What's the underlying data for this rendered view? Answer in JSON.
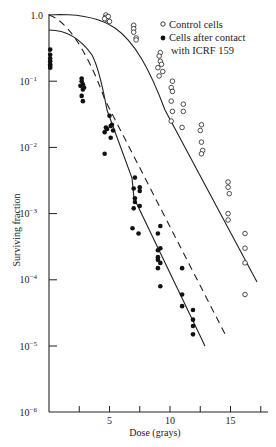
{
  "chart_data": {
    "type": "scatter",
    "title": "",
    "xlabel": "Dose (grays)",
    "ylabel": "Surviving fraction",
    "yscale": "log",
    "xlim": [
      0,
      18
    ],
    "ylim": [
      1e-06,
      1.0
    ],
    "grid": false,
    "legend_position": "upper right",
    "x_ticks": [
      2.5,
      5,
      7.5,
      10,
      12.5,
      15,
      17.5
    ],
    "x_tick_labels": [
      {
        "value": 5,
        "label": "5"
      },
      {
        "value": 10,
        "label": "10"
      },
      {
        "value": 15,
        "label": "15"
      }
    ],
    "y_tick_labels": [
      {
        "value": 1.0,
        "label": "1.0"
      },
      {
        "value": 0.1,
        "label": "10",
        "exp": "−1"
      },
      {
        "value": 0.01,
        "label": "10",
        "exp": "−2"
      },
      {
        "value": 0.001,
        "label": "10",
        "exp": "−3"
      },
      {
        "value": 0.0001,
        "label": "10",
        "exp": "−4"
      },
      {
        "value": 1e-05,
        "label": "10",
        "exp": "−5"
      },
      {
        "value": 1e-06,
        "label": "10",
        "exp": "−6"
      }
    ],
    "legend": [
      {
        "marker": "open-circle",
        "label": "Control cells"
      },
      {
        "marker": "filled-circle",
        "label": "Cells after contact",
        "label2": "with ICRF 159"
      }
    ],
    "series": [
      {
        "name": "Control cells",
        "marker": "open-circle",
        "points": [
          [
            4.7,
            1.0
          ],
          [
            4.7,
            0.92
          ],
          [
            4.8,
            0.85
          ],
          [
            4.6,
            0.88
          ],
          [
            5.0,
            0.8
          ],
          [
            4.9,
            0.95
          ],
          [
            7.0,
            0.7
          ],
          [
            7.0,
            0.62
          ],
          [
            7.0,
            0.55
          ],
          [
            7.2,
            0.45
          ],
          [
            7.2,
            0.42
          ],
          [
            9.2,
            0.27
          ],
          [
            9.1,
            0.24
          ],
          [
            9.2,
            0.2
          ],
          [
            9.0,
            0.16
          ],
          [
            9.1,
            0.12
          ],
          [
            9.3,
            0.18
          ],
          [
            9.4,
            0.14
          ],
          [
            10.2,
            0.1
          ],
          [
            10.1,
            0.08
          ],
          [
            10.2,
            0.07
          ],
          [
            10.1,
            0.05
          ],
          [
            10.2,
            0.035
          ],
          [
            11.1,
            0.045
          ],
          [
            11.1,
            0.035
          ],
          [
            10.1,
            0.025
          ],
          [
            11.0,
            0.02
          ],
          [
            12.6,
            0.022
          ],
          [
            12.5,
            0.018
          ],
          [
            12.6,
            0.012
          ],
          [
            12.7,
            0.009
          ],
          [
            12.6,
            0.008
          ],
          [
            14.8,
            0.003
          ],
          [
            14.8,
            0.0025
          ],
          [
            14.9,
            0.002
          ],
          [
            14.8,
            0.001
          ],
          [
            14.8,
            0.0008
          ],
          [
            16.2,
            0.0005
          ],
          [
            16.2,
            0.0003
          ],
          [
            16.2,
            0.00018
          ],
          [
            16.2,
            6e-05
          ]
        ],
        "fit_line": "solid"
      },
      {
        "name": "Cells after contact with ICRF 159",
        "marker": "filled-circle",
        "points": [
          [
            0.1,
            0.3
          ],
          [
            0.1,
            0.25
          ],
          [
            0.1,
            0.22
          ],
          [
            0.1,
            0.2
          ],
          [
            0.1,
            0.18
          ],
          [
            0.1,
            0.17
          ],
          [
            0.1,
            0.16
          ],
          [
            2.7,
            0.11
          ],
          [
            2.7,
            0.1
          ],
          [
            2.8,
            0.09
          ],
          [
            2.6,
            0.085
          ],
          [
            2.8,
            0.075
          ],
          [
            2.9,
            0.08
          ],
          [
            2.7,
            0.06
          ],
          [
            2.8,
            0.05
          ],
          [
            5.0,
            0.03
          ],
          [
            4.7,
            0.02
          ],
          [
            4.8,
            0.019
          ],
          [
            5.1,
            0.021
          ],
          [
            5.2,
            0.022
          ],
          [
            5.3,
            0.018
          ],
          [
            4.6,
            0.017
          ],
          [
            5.1,
            0.014
          ],
          [
            4.6,
            0.008
          ],
          [
            7.1,
            0.0035
          ],
          [
            7.0,
            0.0024
          ],
          [
            7.5,
            0.0025
          ],
          [
            7.5,
            0.0022
          ],
          [
            7.1,
            0.0017
          ],
          [
            7.1,
            0.0015
          ],
          [
            7.0,
            0.0012
          ],
          [
            7.5,
            0.0013
          ],
          [
            6.9,
            0.0006
          ],
          [
            7.4,
            0.0005
          ],
          [
            9.2,
            0.00065
          ],
          [
            9.0,
            0.0005
          ],
          [
            9.2,
            0.0003
          ],
          [
            9.0,
            0.00028
          ],
          [
            9.0,
            0.00022
          ],
          [
            9.0,
            0.0002
          ],
          [
            9.0,
            0.00015
          ],
          [
            9.2,
            0.00018
          ],
          [
            9.2,
            8e-05
          ],
          [
            11.0,
            0.00015
          ],
          [
            11.0,
            6e-05
          ],
          [
            11.0,
            4e-05
          ],
          [
            11.9,
            3.5e-05
          ],
          [
            11.9,
            2.5e-05
          ],
          [
            11.9,
            2e-05
          ],
          [
            11.9,
            1.5e-05
          ]
        ],
        "fit_line": "solid"
      },
      {
        "name": "Reference curve",
        "marker": "none",
        "fit_line": "dashed",
        "curve_approx": [
          [
            0,
            1.0
          ],
          [
            2.5,
            0.3
          ],
          [
            5,
            0.04
          ],
          [
            7.5,
            0.004
          ],
          [
            10,
            0.0004
          ],
          [
            12.5,
            4e-05
          ],
          [
            14.6,
            1e-05
          ]
        ]
      }
    ]
  }
}
